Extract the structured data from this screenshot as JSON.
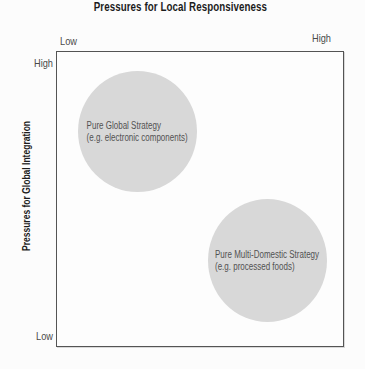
{
  "figure": {
    "top_axis": {
      "title": "Pressures for Local Responsiveness",
      "left_tick": "Low",
      "right_tick": "High"
    },
    "left_axis": {
      "title": "Pressures for Global Integration",
      "top_tick": "High",
      "bottom_tick": "Low"
    },
    "bubbles": [
      {
        "label": "Pure Global Strategy",
        "example": "(e.g. electronic components)",
        "quadrant": "high global integration / low local responsiveness",
        "center": {
          "x": 0.28,
          "y": 0.27
        },
        "radius": 0.21
      },
      {
        "label": "Pure Multi-Domestic Strategy",
        "example": "(e.g. processed foods)",
        "quadrant": "low global integration / high local responsiveness",
        "center": {
          "x": 0.73,
          "y": 0.71
        },
        "radius": 0.21
      }
    ],
    "colors": {
      "bubble_fill": "#d8d8d8",
      "box_border": "#545454",
      "title_text": "#1c1c1c",
      "tick_text": "#4a4a4a",
      "bubble_text": "#525252"
    }
  }
}
